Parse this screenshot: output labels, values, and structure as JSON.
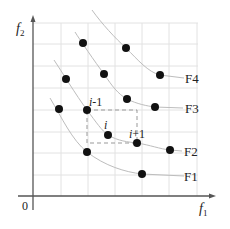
{
  "diagram": {
    "axes": {
      "x_label": "f",
      "x_sub": "1",
      "y_label": "f",
      "y_sub": "2",
      "origin_label": "0"
    },
    "fronts": [
      {
        "label": "F1",
        "points": [
          [
            87,
            152
          ],
          [
            142,
            174
          ]
        ]
      },
      {
        "label": "F2",
        "points": [
          [
            66,
            79
          ],
          [
            87,
            110
          ],
          [
            108,
            135
          ],
          [
            137,
            143
          ],
          [
            170,
            150
          ]
        ]
      },
      {
        "label": "F3",
        "points": [
          [
            83,
            43
          ],
          [
            104,
            74
          ],
          [
            127,
            99
          ],
          [
            155,
            107
          ]
        ]
      },
      {
        "label": "F4",
        "points": [
          [
            126,
            48
          ],
          [
            160,
            75
          ]
        ]
      }
    ],
    "extra_points": [
      [
        59,
        109
      ]
    ],
    "annotations": {
      "prev": "i-1",
      "current": "i",
      "next": "i+1"
    },
    "colors": {
      "grid": "#e2e2e2",
      "curve": "#bdbdbd",
      "axis": "#555555",
      "point": "#111111",
      "dashed": "#999999"
    }
  }
}
